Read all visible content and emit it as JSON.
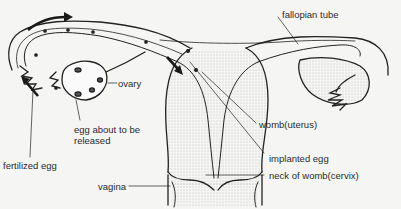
{
  "diagram": {
    "labels": {
      "fallopian_tube": "fallopian tube",
      "ovary": "ovary",
      "egg_release_line1": "egg about to be",
      "egg_release_line2": "released",
      "fertilized_egg": "fertilized egg",
      "womb": "womb(uterus)",
      "implanted_egg": "implanted egg",
      "cervix": "neck of womb(cervix)",
      "vagina": "vagina"
    },
    "arrows": [
      "egg-movement-top-arrow",
      "egg-movement-left-arrow",
      "egg-movement-down-arrow"
    ],
    "colors": {
      "line": "#222222",
      "background": "#f5f5f3",
      "stipple": "#9a9a9a"
    }
  }
}
